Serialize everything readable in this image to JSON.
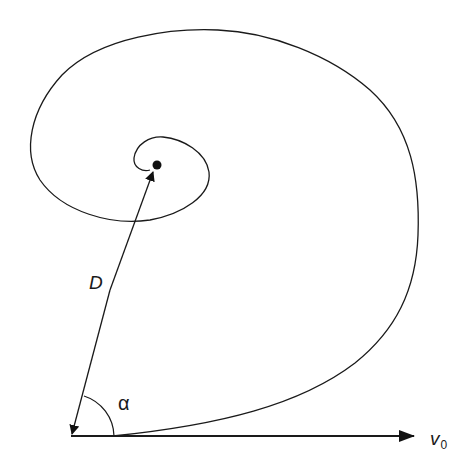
{
  "diagram": {
    "labels": {
      "distance": "D",
      "angle": "α",
      "velocity": "v",
      "velocity_subscript": "0"
    },
    "elements": [
      "spiral trajectory",
      "center point",
      "distance vector D",
      "velocity vector v0",
      "angle arc α"
    ]
  }
}
